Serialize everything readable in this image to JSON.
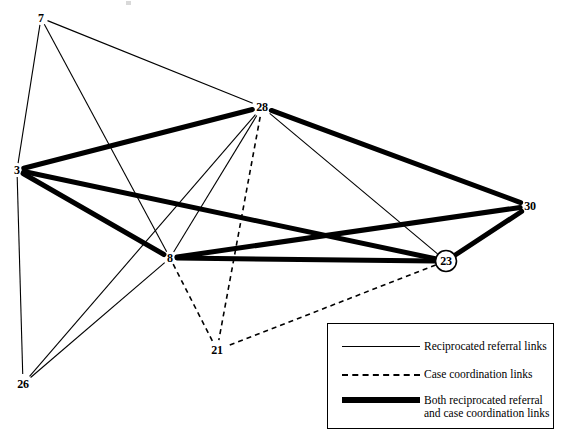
{
  "figure": {
    "type": "network-diagram"
  },
  "nodes": [
    {
      "id": "7",
      "label": "7",
      "x": 41,
      "y": 18,
      "circled": false,
      "label_dx": 0,
      "label_dy": 0
    },
    {
      "id": "28",
      "label": "28",
      "x": 262,
      "y": 107,
      "circled": false,
      "label_dx": 0,
      "label_dy": 0
    },
    {
      "id": "3",
      "label": "3",
      "x": 17,
      "y": 170,
      "circled": false,
      "label_dx": 0,
      "label_dy": 0
    },
    {
      "id": "30",
      "label": "30",
      "x": 530,
      "y": 206,
      "circled": false,
      "label_dx": 0,
      "label_dy": 0
    },
    {
      "id": "8",
      "label": "8",
      "x": 170,
      "y": 258,
      "circled": false,
      "label_dx": 0,
      "label_dy": 0
    },
    {
      "id": "23",
      "label": "23",
      "x": 446,
      "y": 261,
      "circled": true,
      "label_dx": 0,
      "label_dy": 0
    },
    {
      "id": "21",
      "label": "21",
      "x": 217,
      "y": 350,
      "circled": false,
      "label_dx": 0,
      "label_dy": 0
    },
    {
      "id": "26",
      "label": "26",
      "x": 23,
      "y": 384,
      "circled": false,
      "label_dx": 0,
      "label_dy": 0
    }
  ],
  "edges": [
    {
      "source": "7",
      "target": "28",
      "kind": "referral"
    },
    {
      "source": "7",
      "target": "3",
      "kind": "referral"
    },
    {
      "source": "7",
      "target": "8",
      "kind": "referral"
    },
    {
      "source": "3",
      "target": "26",
      "kind": "referral"
    },
    {
      "source": "26",
      "target": "8",
      "kind": "referral"
    },
    {
      "source": "26",
      "target": "28",
      "kind": "referral"
    },
    {
      "source": "28",
      "target": "8",
      "kind": "referral"
    },
    {
      "source": "28",
      "target": "23",
      "kind": "referral"
    },
    {
      "source": "3",
      "target": "28",
      "kind": "both"
    },
    {
      "source": "3",
      "target": "23",
      "kind": "both"
    },
    {
      "source": "3",
      "target": "8",
      "kind": "both"
    },
    {
      "source": "28",
      "target": "30",
      "kind": "both"
    },
    {
      "source": "8",
      "target": "30",
      "kind": "both"
    },
    {
      "source": "8",
      "target": "23",
      "kind": "both"
    },
    {
      "source": "23",
      "target": "30",
      "kind": "both"
    },
    {
      "source": "28",
      "target": "21",
      "kind": "coordination"
    },
    {
      "source": "8",
      "target": "21",
      "kind": "coordination"
    },
    {
      "source": "23",
      "target": "21",
      "kind": "coordination"
    }
  ],
  "edge_styles": {
    "referral": {
      "color": "#000000",
      "width": 1.1,
      "dash": "none"
    },
    "coordination": {
      "color": "#000000",
      "width": 1.6,
      "dash": "5,4"
    },
    "both": {
      "color": "#000000",
      "width": 5.0,
      "dash": "none"
    }
  },
  "legend": {
    "items": [
      {
        "sample": "thin-line",
        "label": "Reciprocated referral links"
      },
      {
        "sample": "dashed-line",
        "label": "Case coordination links"
      },
      {
        "sample": "thick-line",
        "label": "Both reciprocated referral and case coordination links"
      }
    ]
  }
}
